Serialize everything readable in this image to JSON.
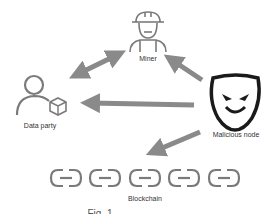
{
  "nodes": {
    "miner": {
      "label": "Miner",
      "icon": "miner-icon"
    },
    "data_party": {
      "label": "Data party",
      "icon": "user-with-box-icon"
    },
    "malicious": {
      "label": "Malicious node",
      "icon": "evil-mask-icon"
    },
    "blockchain": {
      "label": "Blockchain",
      "icon": "chain-link-icon",
      "count": 5
    }
  },
  "edges": [
    {
      "from": "miner",
      "to": "data_party",
      "type": "bidirectional"
    },
    {
      "from": "malicious",
      "to": "miner",
      "type": "directed"
    },
    {
      "from": "malicious",
      "to": "data_party",
      "type": "directed"
    },
    {
      "from": "malicious",
      "to": "blockchain",
      "type": "directed"
    }
  ],
  "caption": "Fig. 1",
  "colors": {
    "arrow": "#8a8a8a",
    "icon": "#7a7a7a",
    "mask": "#1a1a1a"
  }
}
